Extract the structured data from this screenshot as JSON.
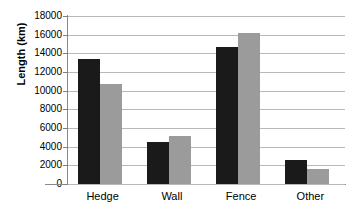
{
  "chart_data": {
    "type": "bar",
    "title": "",
    "xlabel": "",
    "ylabel": "Length (km)",
    "categories": [
      "Hedge",
      "Wall",
      "Fence",
      "Other"
    ],
    "series": [
      {
        "name": "series-a",
        "color": "#1a1a1a",
        "values": [
          13400,
          4500,
          14700,
          2600
        ]
      },
      {
        "name": "series-b",
        "color": "#9b9b9b",
        "values": [
          10700,
          5100,
          16200,
          1600
        ]
      }
    ],
    "ylim": [
      0,
      18000
    ],
    "ytick_step": 2000,
    "yticks": [
      0,
      2000,
      4000,
      6000,
      8000,
      10000,
      12000,
      14000,
      16000,
      18000
    ],
    "ytick_labels": [
      "0",
      "2000",
      "4000",
      "6000",
      "8000",
      "10000",
      "12000",
      "14000",
      "16000",
      "18000"
    ],
    "grid": true,
    "grid_axis": "y",
    "legend": false,
    "legend_position": "none",
    "background_color": "#ffffff",
    "axis_color": "#8a8a8a",
    "gridline_color": "#b8b8b8"
  }
}
